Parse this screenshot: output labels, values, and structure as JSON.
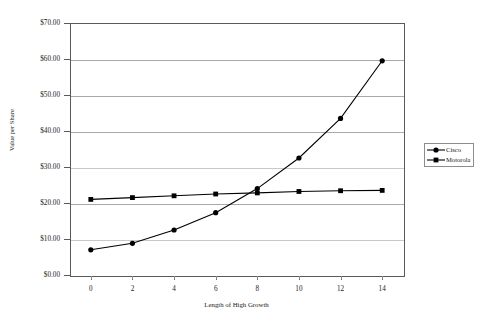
{
  "chart_data": {
    "type": "line",
    "title": "",
    "xlabel": "Length of High Growth",
    "ylabel": "Value per Share",
    "x": [
      0,
      2,
      4,
      6,
      8,
      10,
      12,
      14
    ],
    "xlim": [
      -1,
      15
    ],
    "ylim": [
      0,
      70
    ],
    "xticks": [
      0,
      2,
      4,
      6,
      8,
      10,
      12,
      14
    ],
    "xtick_labels": [
      "0",
      "2",
      "4",
      "6",
      "8",
      "10",
      "12",
      "14"
    ],
    "yticks": [
      0,
      10,
      20,
      30,
      40,
      50,
      60,
      70
    ],
    "ytick_labels": [
      "$0.00",
      "$10.00",
      "$20.00",
      "$30.00",
      "$40.00",
      "$50.00",
      "$60.00",
      "$70.00"
    ],
    "grid": true,
    "grid_axis": "y",
    "legend_position": "right",
    "series": [
      {
        "name": "Cisco",
        "marker": "circle",
        "color": "#000000",
        "values": [
          7.0,
          8.8,
          12.5,
          17.3,
          24.0,
          32.5,
          43.5,
          59.5
        ]
      },
      {
        "name": "Motorola",
        "marker": "square",
        "color": "#000000",
        "values": [
          21.0,
          21.5,
          22.0,
          22.5,
          22.8,
          23.2,
          23.4,
          23.5
        ]
      }
    ]
  },
  "legend": {
    "entries": [
      {
        "label": "Cisco",
        "marker": "circle-marker-icon"
      },
      {
        "label": "Motorola",
        "marker": "square-marker-icon"
      }
    ]
  },
  "axes": {
    "y_title": "Value per Share",
    "x_title": "Length of High Growth"
  }
}
